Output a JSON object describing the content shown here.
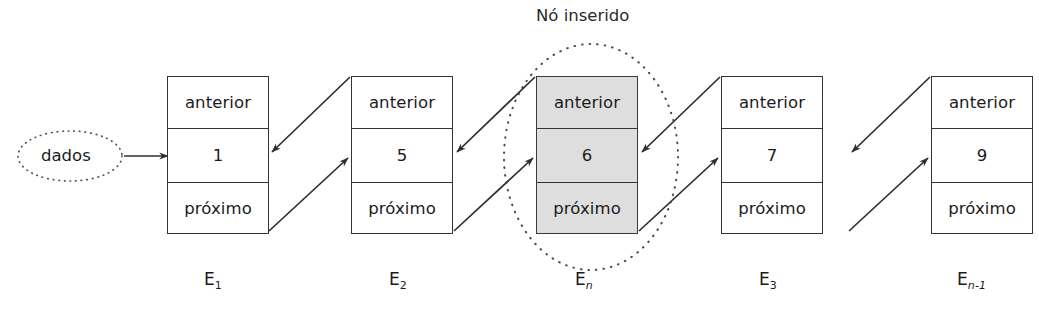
{
  "diagram": {
    "title_annotation": "Nó inserido",
    "source": {
      "label": "dados"
    },
    "field_labels": {
      "prev": "anterior",
      "next": "próximo"
    },
    "nodes": [
      {
        "name": "node-1",
        "value": "1",
        "prev_label": "anterior",
        "next_label": "próximo",
        "label_main": "E",
        "label_sub": "1",
        "label_sub_italic": false,
        "highlighted": false
      },
      {
        "name": "node-2",
        "value": "5",
        "prev_label": "anterior",
        "next_label": "próximo",
        "label_main": "E",
        "label_sub": "2",
        "label_sub_italic": false,
        "highlighted": false
      },
      {
        "name": "node-inserted",
        "value": "6",
        "prev_label": "anterior",
        "next_label": "próximo",
        "label_main": "E",
        "label_sub": "n",
        "label_sub_italic": true,
        "highlighted": true
      },
      {
        "name": "node-3",
        "value": "7",
        "prev_label": "anterior",
        "next_label": "próximo",
        "label_main": "E",
        "label_sub": "3",
        "label_sub_italic": false,
        "highlighted": false
      },
      {
        "name": "node-4",
        "value": "9",
        "prev_label": "anterior",
        "next_label": "próximo",
        "label_main": "E",
        "label_sub": "n-1",
        "label_sub_italic": true,
        "highlighted": false
      }
    ],
    "colors": {
      "stroke": "#333333",
      "highlight_fill": "#dedede",
      "text": "#1b1b1b",
      "background": "#ffffff"
    }
  }
}
